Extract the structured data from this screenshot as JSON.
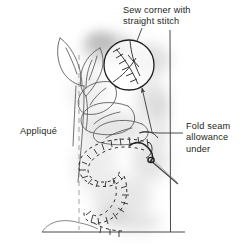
{
  "figure": {
    "kind": "sewing-instruction-illustration",
    "style": "pencil line drawing with gray shading",
    "width": 242,
    "height": 248,
    "colors": {
      "background": "#ffffff",
      "ink": "#231f20",
      "line": "#3a3a3a",
      "shade": "#bdbdbd",
      "shade_light": "#dcdcdc"
    }
  },
  "labels": {
    "sew_corner": "Sew corner with\nstraight stitch",
    "fold_seam": "Fold seam\nallowance\nunder",
    "applique": "Appliqué"
  },
  "annotations": {
    "magnifier": {
      "name": "detail-circle",
      "cx": 129,
      "cy": 65,
      "r": 25,
      "content": "corner fold line crossed by straight stitch marks"
    },
    "arrow": {
      "name": "callout-arrow",
      "from_x": 151,
      "from_y": 131,
      "to_x": 143,
      "to_y": 86
    },
    "leader_sew": {
      "name": "leader-line-sew-corner",
      "from_x": 142,
      "from_y": 27,
      "to_x": 136,
      "to_y": 42
    },
    "leader_fold": {
      "name": "leader-line-fold-seam",
      "from_x": 183,
      "from_y": 133,
      "to_x": 139,
      "to_y": 133
    }
  },
  "drawing_elements": {
    "fabric_edge_vertical": {
      "x": 170,
      "y_top": 30,
      "y_bottom": 232
    },
    "fabric_edge_baseline": {
      "y": 232,
      "x_left": 42,
      "x_right": 185
    },
    "fold_line_dashed": {
      "x": 79,
      "y_top": 55,
      "y_bottom": 230
    },
    "needle": {
      "tip_x": 176,
      "tip_y": 182,
      "eye_x": 152,
      "eye_y": 160
    },
    "stitch_count_outline": 54
  }
}
